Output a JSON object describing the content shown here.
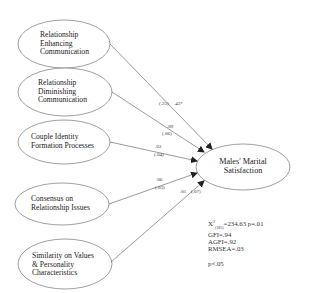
{
  "diagram": {
    "type": "path-model",
    "predictors": [
      {
        "id": "rec",
        "label_lines": [
          "Relationship",
          "Enhancing",
          "Communication"
        ]
      },
      {
        "id": "rdc",
        "label_lines": [
          "Relationship",
          "Diminishing",
          "Communication"
        ]
      },
      {
        "id": "cif",
        "label_lines": [
          "Couple Identity",
          "Formation Processes"
        ]
      },
      {
        "id": "cri",
        "label_lines": [
          "Consensus on",
          "Relationship Issues"
        ]
      },
      {
        "id": "svp",
        "label_lines": [
          "Similarity on Values",
          "& Personality",
          "Characteristics"
        ]
      }
    ],
    "outcome": {
      "id": "mms",
      "label_lines": [
        "Males' Marital",
        "Satisfaction"
      ]
    },
    "paths": [
      {
        "from": "rec",
        "to": "mms",
        "coefficient": ".43*",
        "se": "(.25)"
      },
      {
        "from": "rdc",
        "to": "mms",
        "coefficient": ".09",
        "se": "(.06)"
      },
      {
        "from": "cif",
        "to": "mms",
        "coefficient": ".03",
        "se": "(.04)"
      },
      {
        "from": "cri",
        "to": "mms",
        "coefficient": ".06",
        "se": "(.03)"
      },
      {
        "from": "svp",
        "to": "mms",
        "coefficient": ".01",
        "se": "(.07)"
      }
    ],
    "fit_stats": {
      "chi_square_prefix": "X",
      "chi_square_sup": "2",
      "chi_square_sub": "(185)",
      "chi_square_value": "=234.63 p=.01",
      "gfi": "GFI=.94",
      "agfi": "AGFI=.92",
      "rmsea": "RMSEA=.03"
    },
    "significance_note": "p<.05"
  }
}
